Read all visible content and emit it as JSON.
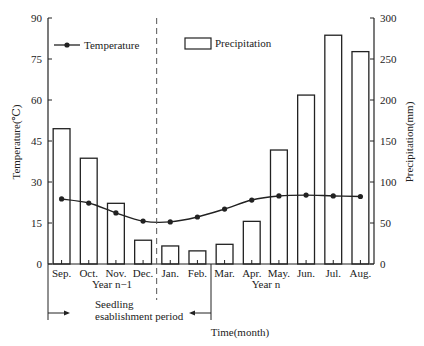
{
  "chart_data": {
    "type": "bar+line",
    "categories": [
      "Sep.",
      "Oct.",
      "Nov.",
      "Dec.",
      "Jan.",
      "Feb.",
      "Mar.",
      "Apr.",
      "May.",
      "Jun.",
      "Jul.",
      "Aug."
    ],
    "series": [
      {
        "name": "Precipitation",
        "kind": "bar",
        "axis": "right",
        "values": [
          165,
          129,
          74,
          29,
          22,
          16,
          24,
          52,
          139,
          206,
          279,
          259
        ]
      },
      {
        "name": "Temperature",
        "kind": "line",
        "axis": "left",
        "values": [
          23.8,
          22.3,
          18.7,
          15.7,
          15.4,
          17.2,
          20.1,
          23.4,
          24.9,
          25.2,
          24.9,
          24.7
        ]
      }
    ],
    "title": "",
    "xlabel": "Time(month)",
    "ylabel_left": "Temperature(℃)",
    "ylabel_right": "Precipitation(mm)",
    "ylim_left": [
      0,
      90
    ],
    "ylim_right": [
      0,
      300
    ],
    "yticks_left": [
      0,
      15,
      30,
      45,
      60,
      75,
      90
    ],
    "yticks_right": [
      0,
      50,
      100,
      150,
      200,
      250,
      300
    ],
    "grid": false,
    "legend": [
      {
        "label": "Temperature",
        "marker": "line-dot",
        "placement": "top-left"
      },
      {
        "label": "Precipitation",
        "marker": "open-rect",
        "placement": "top-center"
      }
    ],
    "annotations": {
      "year_prev": "Year n−1",
      "year_curr": "Year n",
      "period_line1": "Seedling",
      "period_line2": "esablishment period",
      "divider": "dashed line between Dec. and Jan."
    }
  }
}
